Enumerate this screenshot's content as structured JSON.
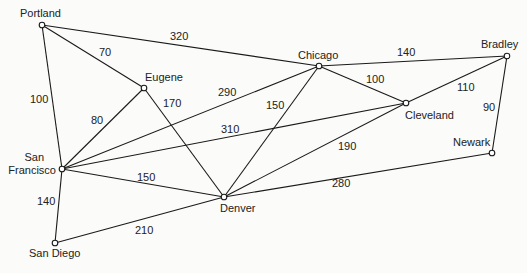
{
  "diagram": {
    "type": "weighted-undirected-graph",
    "nodes": [
      {
        "id": "portland",
        "label": "Portland",
        "x": 42,
        "y": 25,
        "lx": 20,
        "ly": 17,
        "anchor": "start"
      },
      {
        "id": "eugene",
        "label": "Eugene",
        "x": 144,
        "y": 88,
        "lx": 145,
        "ly": 81,
        "anchor": "start"
      },
      {
        "id": "chicago",
        "label": "Chicago",
        "x": 319,
        "y": 66,
        "lx": 298,
        "ly": 59,
        "anchor": "start"
      },
      {
        "id": "bradley",
        "label": "Bradley",
        "x": 507,
        "y": 56,
        "lx": 481,
        "ly": 48,
        "anchor": "start"
      },
      {
        "id": "cleveland",
        "label": "Cleveland",
        "x": 406,
        "y": 103,
        "lx": 405,
        "ly": 119,
        "anchor": "start"
      },
      {
        "id": "newark",
        "label": "Newark",
        "x": 492,
        "y": 153,
        "lx": 453,
        "ly": 146,
        "anchor": "start"
      },
      {
        "id": "sanfrancisco",
        "label": "San Francisco",
        "label_lines": [
          "San",
          "Francisco"
        ],
        "x": 62,
        "y": 169,
        "lx": 56,
        "ly": 161,
        "anchor": "end"
      },
      {
        "id": "denver",
        "label": "Denver",
        "x": 224,
        "y": 197,
        "lx": 220,
        "ly": 212,
        "anchor": "start"
      },
      {
        "id": "sandiego",
        "label": "San Diego",
        "x": 55,
        "y": 243,
        "lx": 29,
        "ly": 257,
        "anchor": "start"
      }
    ],
    "edges": [
      {
        "from": "portland",
        "to": "chicago",
        "weight": "320",
        "wx": 170,
        "wy": 40
      },
      {
        "from": "portland",
        "to": "eugene",
        "weight": "70",
        "wx": 99,
        "wy": 56
      },
      {
        "from": "portland",
        "to": "sanfrancisco",
        "weight": "100",
        "wx": 30,
        "wy": 103
      },
      {
        "from": "eugene",
        "to": "sanfrancisco",
        "weight": "80",
        "wx": 91,
        "wy": 124
      },
      {
        "from": "eugene",
        "to": "denver",
        "weight": "170",
        "wx": 163,
        "wy": 107
      },
      {
        "from": "chicago",
        "to": "sanfrancisco",
        "weight": "290",
        "wx": 218,
        "wy": 96
      },
      {
        "from": "chicago",
        "to": "denver",
        "weight": "150",
        "wx": 266,
        "wy": 109
      },
      {
        "from": "chicago",
        "to": "bradley",
        "weight": "140",
        "wx": 397,
        "wy": 56
      },
      {
        "from": "chicago",
        "to": "cleveland",
        "weight": "100",
        "wx": 366,
        "wy": 83
      },
      {
        "from": "bradley",
        "to": "cleveland",
        "weight": "110",
        "wx": 457,
        "wy": 91
      },
      {
        "from": "bradley",
        "to": "newark",
        "weight": "90",
        "wx": 483,
        "wy": 111
      },
      {
        "from": "cleveland",
        "to": "sanfrancisco",
        "weight": "310",
        "wx": 221,
        "wy": 133
      },
      {
        "from": "cleveland",
        "to": "denver",
        "weight": "190",
        "wx": 338,
        "wy": 150
      },
      {
        "from": "sanfrancisco",
        "to": "denver",
        "weight": "150",
        "wx": 137,
        "wy": 181
      },
      {
        "from": "sanfrancisco",
        "to": "sandiego",
        "weight": "140",
        "wx": 37,
        "wy": 205
      },
      {
        "from": "denver",
        "to": "newark",
        "weight": "280",
        "wx": 332,
        "wy": 187
      },
      {
        "from": "sandiego",
        "to": "denver",
        "weight": "210",
        "wx": 135,
        "wy": 234
      }
    ]
  }
}
